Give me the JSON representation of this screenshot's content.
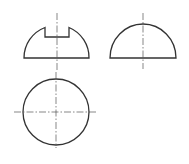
{
  "drawing": {
    "title": "Orthographic views of slotted half-sphere",
    "colors": {
      "outline": "#333333",
      "centerline": "#555555",
      "background": "#ffffff"
    },
    "views": [
      {
        "name": "front-view",
        "shape": "half-dome with rectangular slot"
      },
      {
        "name": "side-view",
        "shape": "half-dome"
      },
      {
        "name": "top-view",
        "shape": "circle"
      }
    ]
  }
}
